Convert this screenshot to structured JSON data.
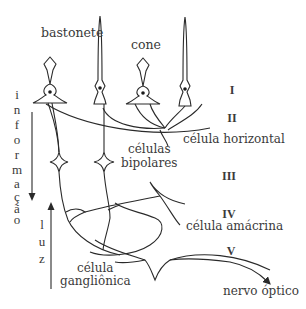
{
  "diagram": {
    "labels": {
      "rod": "bastonete",
      "cone": "cone",
      "bipolar_line1": "células",
      "bipolar_line2": "bipolares",
      "horizontal": "célula horizontal",
      "amacrine": "célula amácrina",
      "ganglion_line1": "célula",
      "ganglion_line2": "gangliônica",
      "optic_nerve": "nervo óptico"
    },
    "layers": [
      "I",
      "II",
      "III",
      "IV",
      "V"
    ],
    "arrows": {
      "information": {
        "letters": [
          "i",
          "n",
          "f",
          "o",
          "r",
          "m",
          "a",
          "ç",
          "ã",
          "o"
        ],
        "direction": "down"
      },
      "light": {
        "letters": [
          "l",
          "u",
          "z"
        ],
        "direction": "up"
      }
    },
    "colors": {
      "line": "#2a2a2a",
      "text": "#3a3a3a",
      "background": "#ffffff"
    }
  }
}
